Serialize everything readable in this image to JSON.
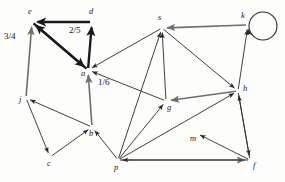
{
  "figure": {
    "type": "directed-graph",
    "background_color": "#fdfdfc",
    "ink_color": "#2b2b2b",
    "bold_ink_color": "#1a1a1a",
    "gray_ink_color": "#6e6e6e"
  },
  "nodes": [
    {
      "id": "e",
      "label": "e",
      "x": 32,
      "y": 22,
      "label_x": 28,
      "label_y": 14
    },
    {
      "id": "d",
      "label": "d",
      "x": 92,
      "y": 22,
      "label_x": 89,
      "label_y": 14
    },
    {
      "id": "a",
      "label": "a",
      "x": 88,
      "y": 70,
      "label_x": 81,
      "label_y": 76
    },
    {
      "id": "j",
      "label": "j",
      "x": 26,
      "y": 98,
      "label_x": 19,
      "label_y": 102
    },
    {
      "id": "c",
      "label": "c",
      "x": 50,
      "y": 157,
      "label_x": 47,
      "label_y": 166
    },
    {
      "id": "b",
      "label": "b",
      "x": 92,
      "y": 127,
      "label_x": 89,
      "label_y": 136
    },
    {
      "id": "p",
      "label": "p",
      "x": 118,
      "y": 160,
      "label_x": 114,
      "label_y": 170
    },
    {
      "id": "s",
      "label": "s",
      "x": 162,
      "y": 28,
      "label_x": 158,
      "label_y": 20
    },
    {
      "id": "g",
      "label": "g",
      "x": 166,
      "y": 101,
      "label_x": 167,
      "label_y": 110
    },
    {
      "id": "k",
      "label": "k",
      "x": 248,
      "y": 25,
      "label_x": 241,
      "label_y": 18
    },
    {
      "id": "h",
      "label": "h",
      "x": 238,
      "y": 91,
      "label_x": 243,
      "label_y": 91
    },
    {
      "id": "m",
      "label": "m",
      "x": 196,
      "y": 133,
      "label_x": 190,
      "label_y": 141
    },
    {
      "id": "f",
      "label": "f",
      "x": 250,
      "y": 160,
      "label_x": 253,
      "label_y": 168
    }
  ],
  "edges": [
    {
      "from": "d",
      "to": "e",
      "style": "bold",
      "label": "2/5",
      "label_x": 69,
      "label_y": 33
    },
    {
      "from": "a",
      "to": "d",
      "style": "bold",
      "label": "",
      "label_x": 0,
      "label_y": 0
    },
    {
      "from": "a",
      "to": "e",
      "style": "bold",
      "label": "",
      "label_x": 0,
      "label_y": 0
    },
    {
      "from": "e",
      "to": "a",
      "style": "bold",
      "label": "",
      "label_x": 0,
      "label_y": 0
    },
    {
      "from": "j",
      "to": "e",
      "style": "gray",
      "label": "3/4",
      "label_x": 4,
      "label_y": 39
    },
    {
      "from": "b",
      "to": "a",
      "style": "gray",
      "label": "1/6",
      "label_x": 98,
      "label_y": 85
    },
    {
      "from": "s",
      "to": "a",
      "style": "thin",
      "label": "",
      "label_x": 0,
      "label_y": 0
    },
    {
      "from": "g",
      "to": "a",
      "style": "thin",
      "label": "",
      "label_x": 0,
      "label_y": 0
    },
    {
      "from": "b",
      "to": "j",
      "style": "thin",
      "label": "",
      "label_x": 0,
      "label_y": 0
    },
    {
      "from": "j",
      "to": "c",
      "style": "thin",
      "label": "",
      "label_x": 0,
      "label_y": 0
    },
    {
      "from": "c",
      "to": "b",
      "style": "thin",
      "label": "",
      "label_x": 0,
      "label_y": 0
    },
    {
      "from": "p",
      "to": "b",
      "style": "thin",
      "label": "",
      "label_x": 0,
      "label_y": 0
    },
    {
      "from": "p",
      "to": "g",
      "style": "thin",
      "label": "",
      "label_x": 0,
      "label_y": 0
    },
    {
      "from": "g",
      "to": "s",
      "style": "thin",
      "label": "",
      "label_x": 0,
      "label_y": 0
    },
    {
      "from": "p",
      "to": "s",
      "style": "thin",
      "label": "",
      "label_x": 0,
      "label_y": 0
    },
    {
      "from": "k",
      "to": "s",
      "style": "gray",
      "label": "",
      "label_x": 0,
      "label_y": 0
    },
    {
      "from": "s",
      "to": "h",
      "style": "thin",
      "label": "",
      "label_x": 0,
      "label_y": 0
    },
    {
      "from": "h",
      "to": "g",
      "style": "gray",
      "label": "",
      "label_x": 0,
      "label_y": 0
    },
    {
      "from": "h",
      "to": "k",
      "style": "thin",
      "label": "",
      "label_x": 0,
      "label_y": 0
    },
    {
      "from": "f",
      "to": "h",
      "style": "thin",
      "label": "",
      "label_x": 0,
      "label_y": 0
    },
    {
      "from": "h",
      "to": "f",
      "style": "thin",
      "label": "",
      "label_x": 0,
      "label_y": 0
    },
    {
      "from": "f",
      "to": "m",
      "style": "thin",
      "label": "",
      "label_x": 0,
      "label_y": 0
    },
    {
      "from": "p",
      "to": "h",
      "style": "thin",
      "label": "",
      "label_x": 0,
      "label_y": 0
    },
    {
      "from": "p",
      "to": "f",
      "style": "gray",
      "label": "",
      "label_x": 0,
      "label_y": 0
    },
    {
      "from": "f",
      "to": "p",
      "style": "thin",
      "label": "",
      "label_x": 0,
      "label_y": 0
    }
  ],
  "self_loops": [
    {
      "node": "k",
      "cx": 263,
      "cy": 26,
      "r": 14
    }
  ],
  "edge_labels": [
    {
      "text": "3/4",
      "x": 4,
      "y": 39
    },
    {
      "text": "2/5",
      "x": 69,
      "y": 33
    },
    {
      "text": "1/6",
      "x": 98,
      "y": 85
    }
  ]
}
